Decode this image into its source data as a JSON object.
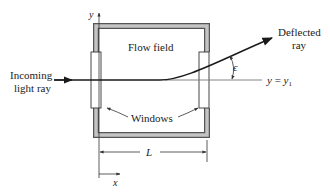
{
  "diagram": {
    "labels": {
      "incoming_line1": "Incoming",
      "incoming_line2": "light ray",
      "flow_field": "Flow field",
      "deflected_line1": "Deflected",
      "deflected_line2": "ray",
      "windows": "Windows",
      "epsilon": "ϵ",
      "y_eq_y1_y": "y",
      "y_eq_y1_eq": " = ",
      "y_eq_y1_rhs": "y",
      "y_eq_y1_sub": "1",
      "length": "L",
      "x_axis": "x",
      "y_axis": "y"
    },
    "colors": {
      "line": "#1a1a1a",
      "frame_fill": "#b8b8b8",
      "frame_stroke": "#555555",
      "reference_line": "#777777"
    }
  }
}
